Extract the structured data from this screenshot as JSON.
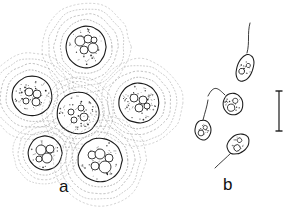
{
  "figure": {
    "type": "scientific-line-drawing",
    "background_color": "#ffffff",
    "ink_color": "#1a1a1a",
    "sheath_color": "#9a9a9a",
    "panels": [
      {
        "id": "a",
        "label": "a",
        "label_x": 59,
        "label_y": 178,
        "description": "vegetative cells with granular protoplast inside concentric dotted mucilage sheaths",
        "cells": [
          {
            "name": "cell-top",
            "cx": 86,
            "cy": 47,
            "rx": 20,
            "ry": 21,
            "sheaths": 4,
            "sheath_pad": 6,
            "granules": 34,
            "vacuoles": [
              [
                -6,
                -6,
                5
              ],
              [
                2,
                -8,
                4
              ],
              [
                7,
                1,
                5
              ],
              [
                -2,
                3,
                4
              ],
              [
                8,
                -7,
                3
              ]
            ]
          },
          {
            "name": "cell-left",
            "cx": 32,
            "cy": 96,
            "rx": 20,
            "ry": 20,
            "sheaths": 4,
            "sheath_pad": 6,
            "granules": 48,
            "vacuoles": [
              [
                -3,
                -4,
                4
              ],
              [
                5,
                -2,
                4
              ],
              [
                -6,
                5,
                3
              ],
              [
                4,
                6,
                4
              ]
            ]
          },
          {
            "name": "cell-center",
            "cx": 78,
            "cy": 113,
            "rx": 21,
            "ry": 21,
            "sheaths": 3,
            "sheath_pad": 5,
            "granules": 40,
            "vacuoles": [
              [
                -7,
                -1,
                3
              ],
              [
                3,
                -5,
                3
              ],
              [
                6,
                4,
                4
              ],
              [
                -4,
                7,
                3
              ]
            ]
          },
          {
            "name": "cell-right",
            "cx": 139,
            "cy": 103,
            "rx": 20,
            "ry": 20,
            "sheaths": 4,
            "sheath_pad": 6,
            "granules": 46,
            "vacuoles": [
              [
                -5,
                -5,
                4
              ],
              [
                4,
                -3,
                4
              ],
              [
                0,
                5,
                4
              ],
              [
                8,
                3,
                3
              ]
            ]
          },
          {
            "name": "cell-lower-left",
            "cx": 45,
            "cy": 153,
            "rx": 17,
            "ry": 17,
            "sheaths": 3,
            "sheath_pad": 5,
            "granules": 26,
            "vacuoles": [
              [
                -4,
                -3,
                5
              ],
              [
                5,
                -4,
                4
              ],
              [
                2,
                5,
                5
              ],
              [
                -6,
                6,
                3
              ]
            ]
          },
          {
            "name": "cell-lower-right",
            "cx": 100,
            "cy": 160,
            "rx": 22,
            "ry": 22,
            "sheaths": 4,
            "sheath_pad": 6,
            "granules": 30,
            "vacuoles": [
              [
                -8,
                -5,
                4
              ],
              [
                0,
                -6,
                5
              ],
              [
                9,
                -2,
                4
              ],
              [
                5,
                7,
                6
              ],
              [
                -5,
                6,
                4
              ]
            ]
          }
        ]
      },
      {
        "id": "b",
        "label": "b",
        "label_x": 223,
        "label_y": 176,
        "description": "biflagellate zoospores with trailing flagella, and a vertical scale bar",
        "zoospores": [
          {
            "name": "zoospore-upper",
            "cx": 245,
            "cy": 68,
            "rx": 8,
            "ry": 14,
            "rot": 20,
            "flagellum": "M247,53 C250,42 247,34 250,23"
          },
          {
            "name": "zoospore-middle",
            "cx": 233,
            "cy": 104,
            "rx": 10,
            "ry": 11,
            "rot": -10,
            "flagellum": "M225,95 C218,88 214,84 208,96"
          },
          {
            "name": "zoospore-left",
            "cx": 203,
            "cy": 130,
            "rx": 8,
            "ry": 10,
            "rot": 0,
            "flagellum": "M203,120 C205,112 207,107 208,100"
          },
          {
            "name": "zoospore-lower",
            "cx": 238,
            "cy": 144,
            "rx": 12,
            "ry": 9,
            "rot": -35,
            "flagellum": "M232,152 C226,158 220,163 215,168"
          }
        ],
        "scale_bar": {
          "name": "scale-bar",
          "x": 279,
          "y_top": 91,
          "y_bottom": 131,
          "cap_width": 7,
          "orientation": "vertical"
        }
      }
    ]
  }
}
